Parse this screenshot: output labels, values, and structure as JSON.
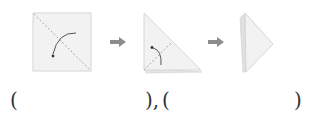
{
  "diagram": {
    "steps": [
      {
        "id": "step-1",
        "shape": "square",
        "fold": "diagonal",
        "icon": "fold-arrow-icon"
      },
      {
        "id": "step-2",
        "shape": "triangle",
        "fold": "diagonal",
        "icon": "fold-arrow-icon"
      },
      {
        "id": "step-3",
        "shape": "narrow-triangle"
      }
    ],
    "connectors": [
      "right-arrow-icon",
      "right-arrow-icon"
    ],
    "colors": {
      "paper": "#f2f2f2",
      "paper_edge": "#d6d6d6",
      "fold_line": "#a8a8a8",
      "arrow": "#8c8c8c",
      "curve": "#555555"
    }
  },
  "answers": {
    "open_1": "(",
    "close_1": "),",
    "open_2": "(",
    "close_2": ")"
  }
}
